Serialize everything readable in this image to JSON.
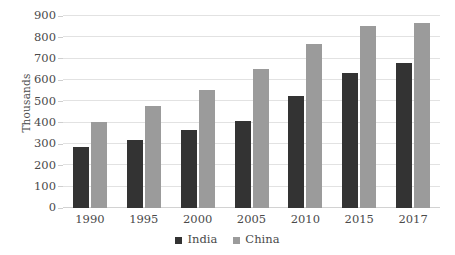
{
  "chart_data": {
    "type": "bar",
    "title": "",
    "subtitle": "",
    "xlabel": "",
    "ylabel": "Thousands",
    "categories": [
      "1990",
      "1995",
      "2000",
      "2005",
      "2010",
      "2015",
      "2017"
    ],
    "series": [
      {
        "name": "India",
        "color": "#333333",
        "values": [
          285,
          320,
          367,
          407,
          523,
          635,
          682
        ]
      },
      {
        "name": "China",
        "color": "#9b9b9b",
        "values": [
          405,
          480,
          553,
          650,
          770,
          852,
          865
        ]
      }
    ],
    "ylim": [
      0,
      900
    ],
    "ytick_step": 100,
    "ytick_labels": [
      "0",
      "100",
      "200",
      "300",
      "400",
      "500",
      "600",
      "700",
      "800",
      "900"
    ],
    "grid": true,
    "grid_axis": "y",
    "legend_position": "bottom",
    "background_color": "#ffffff",
    "grid_color": "#e2e2e2",
    "text_color": "#4a4a4a"
  }
}
